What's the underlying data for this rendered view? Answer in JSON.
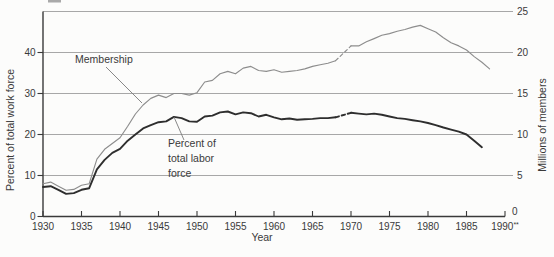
{
  "figure": {
    "x_axis": {
      "label": "Year",
      "tick_years": [
        "1930",
        "1935",
        "1940",
        "1945",
        "1950",
        "1955",
        "1960",
        "1965",
        "1970",
        "1975",
        "1980",
        "1985",
        "1990"
      ],
      "last_tick_suffix": "**"
    },
    "left_axis": {
      "label": "Percent of total work force",
      "ticks": [
        0,
        10,
        20,
        30,
        40
      ]
    },
    "right_axis": {
      "label": "Millions of members",
      "ticks": [
        0,
        5,
        10,
        15,
        20,
        25
      ]
    },
    "annotations": {
      "membership": {
        "label": "Membership"
      },
      "percent": {
        "line1": "Percent of",
        "line2": "total labor",
        "line3": "force"
      }
    },
    "colors": {
      "membership_line": "#8d8d8d",
      "percent_line": "#2e2e2e",
      "gridline": "#9d9d9d",
      "axis": "#3a3a3a",
      "pointer": "#7a7a7a",
      "text": "#3a3a3a",
      "background": "#fcfcfb"
    }
  },
  "chart_data": {
    "type": "line",
    "xlabel": "Year",
    "x_range": [
      1930,
      1990
    ],
    "grid": "horizontal gridlines at every 5 million members (aligned with every 10 percent)",
    "legend_position": "inline annotations with pointer lines",
    "left_axis": {
      "label": "Percent of total work force",
      "ticks": [
        0,
        10,
        20,
        30,
        40
      ],
      "ylim": [
        0,
        50
      ]
    },
    "right_axis": {
      "label": "Millions of members",
      "ticks": [
        0,
        5,
        10,
        15,
        20,
        25
      ],
      "ylim": [
        0,
        25.2
      ]
    },
    "series": [
      {
        "name": "Membership",
        "axis": "right",
        "unit": "millions of members",
        "dashed_break": [
          1968,
          1970
        ],
        "points": [
          [
            1930,
            4.0
          ],
          [
            1931,
            4.2
          ],
          [
            1932,
            3.7
          ],
          [
            1933,
            3.2
          ],
          [
            1934,
            3.3
          ],
          [
            1935,
            3.8
          ],
          [
            1936,
            4.0
          ],
          [
            1937,
            7.0
          ],
          [
            1938,
            8.2
          ],
          [
            1939,
            8.9
          ],
          [
            1940,
            9.6
          ],
          [
            1941,
            11.0
          ],
          [
            1942,
            12.5
          ],
          [
            1943,
            13.6
          ],
          [
            1944,
            14.4
          ],
          [
            1945,
            14.8
          ],
          [
            1946,
            14.5
          ],
          [
            1947,
            15.0
          ],
          [
            1948,
            15.0
          ],
          [
            1949,
            14.8
          ],
          [
            1950,
            15.1
          ],
          [
            1951,
            16.4
          ],
          [
            1952,
            16.6
          ],
          [
            1953,
            17.4
          ],
          [
            1954,
            17.7
          ],
          [
            1955,
            17.4
          ],
          [
            1956,
            18.1
          ],
          [
            1957,
            18.3
          ],
          [
            1958,
            17.8
          ],
          [
            1959,
            17.7
          ],
          [
            1960,
            17.9
          ],
          [
            1961,
            17.6
          ],
          [
            1962,
            17.7
          ],
          [
            1963,
            17.8
          ],
          [
            1964,
            18.0
          ],
          [
            1965,
            18.3
          ],
          [
            1966,
            18.5
          ],
          [
            1967,
            18.7
          ],
          [
            1968,
            19.0
          ],
          [
            1970,
            20.8
          ],
          [
            1971,
            20.8
          ],
          [
            1972,
            21.3
          ],
          [
            1973,
            21.7
          ],
          [
            1974,
            22.1
          ],
          [
            1975,
            22.3
          ],
          [
            1976,
            22.6
          ],
          [
            1977,
            22.8
          ],
          [
            1978,
            23.1
          ],
          [
            1979,
            23.3
          ],
          [
            1980,
            22.9
          ],
          [
            1981,
            22.5
          ],
          [
            1982,
            21.8
          ],
          [
            1983,
            21.2
          ],
          [
            1984,
            20.8
          ],
          [
            1985,
            20.3
          ],
          [
            1986,
            19.5
          ],
          [
            1987,
            18.8
          ],
          [
            1988,
            18.0
          ]
        ]
      },
      {
        "name": "Percent of total labor force",
        "axis": "left",
        "unit": "percent of total work force",
        "dashed_break": [
          1968,
          1970
        ],
        "points": [
          [
            1930,
            7.2
          ],
          [
            1931,
            7.4
          ],
          [
            1932,
            6.5
          ],
          [
            1933,
            5.5
          ],
          [
            1934,
            5.7
          ],
          [
            1935,
            6.5
          ],
          [
            1936,
            6.9
          ],
          [
            1937,
            11.5
          ],
          [
            1938,
            13.8
          ],
          [
            1939,
            15.5
          ],
          [
            1940,
            16.5
          ],
          [
            1941,
            18.5
          ],
          [
            1942,
            20.0
          ],
          [
            1943,
            21.5
          ],
          [
            1944,
            22.3
          ],
          [
            1945,
            23.0
          ],
          [
            1946,
            23.2
          ],
          [
            1947,
            24.3
          ],
          [
            1948,
            24.0
          ],
          [
            1949,
            23.2
          ],
          [
            1950,
            23.1
          ],
          [
            1951,
            24.4
          ],
          [
            1952,
            24.6
          ],
          [
            1953,
            25.4
          ],
          [
            1954,
            25.6
          ],
          [
            1955,
            24.9
          ],
          [
            1956,
            25.4
          ],
          [
            1957,
            25.2
          ],
          [
            1958,
            24.4
          ],
          [
            1959,
            24.8
          ],
          [
            1960,
            24.2
          ],
          [
            1961,
            23.7
          ],
          [
            1962,
            23.9
          ],
          [
            1963,
            23.6
          ],
          [
            1964,
            23.7
          ],
          [
            1965,
            23.8
          ],
          [
            1966,
            24.0
          ],
          [
            1967,
            24.0
          ],
          [
            1968,
            24.2
          ],
          [
            1970,
            25.3
          ],
          [
            1971,
            25.1
          ],
          [
            1972,
            24.9
          ],
          [
            1973,
            25.1
          ],
          [
            1974,
            24.8
          ],
          [
            1975,
            24.4
          ],
          [
            1976,
            24.0
          ],
          [
            1977,
            23.8
          ],
          [
            1978,
            23.5
          ],
          [
            1979,
            23.2
          ],
          [
            1980,
            22.8
          ],
          [
            1981,
            22.3
          ],
          [
            1982,
            21.7
          ],
          [
            1983,
            21.2
          ],
          [
            1984,
            20.7
          ],
          [
            1985,
            20.0
          ],
          [
            1986,
            18.5
          ],
          [
            1987,
            16.9
          ]
        ]
      }
    ]
  }
}
